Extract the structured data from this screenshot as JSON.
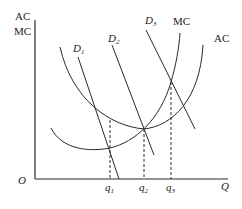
{
  "diagram": {
    "axes": {
      "y_label_line1": "AC",
      "y_label_line2": "MC",
      "origin_label": "O",
      "x_label": "Q"
    },
    "curves": {
      "mc_label": "MC",
      "ac_label": "AC",
      "d1_label": "D",
      "d1_sub": "1",
      "d2_label": "D",
      "d2_sub": "2",
      "d3_label": "D",
      "d3_sub": "3"
    },
    "quantities": [
      {
        "label": "q",
        "sub": "1"
      },
      {
        "label": "q",
        "sub": "2"
      },
      {
        "label": "q",
        "sub": "3"
      }
    ],
    "colors": {
      "line": "#2a2a2a",
      "background": "#ffffff"
    }
  }
}
